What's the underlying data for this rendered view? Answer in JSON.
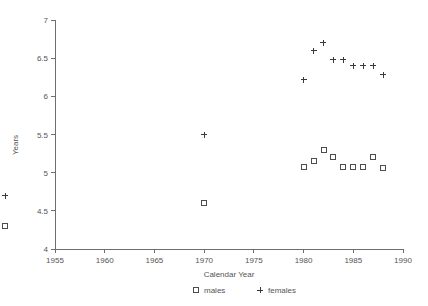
{
  "chart_data": {
    "type": "scatter",
    "title": "",
    "xlabel": "Calendar Year",
    "ylabel": "Years",
    "xlim": [
      1955,
      1990
    ],
    "ylim": [
      4,
      7
    ],
    "xticks": [
      1955,
      1960,
      1965,
      1970,
      1975,
      1980,
      1985,
      1990
    ],
    "xtick_labels": [
      "1955",
      "1960",
      "1965",
      "1970",
      "1975",
      "1980",
      "1985",
      "1990"
    ],
    "yticks": [
      4,
      4.5,
      5,
      5.5,
      6,
      6.5,
      7
    ],
    "ytick_labels": [
      "4",
      "4.5",
      "5",
      "5.5",
      "6",
      "6.5",
      "7"
    ],
    "grid": false,
    "legend_position": "below-xlabel",
    "series": [
      {
        "name": "males",
        "marker": "square",
        "marker_glyph": "□",
        "color": "#4d4d4d",
        "points": [
          {
            "x": 1950,
            "y": 4.3
          },
          {
            "x": 1970,
            "y": 4.6
          },
          {
            "x": 1980,
            "y": 5.08
          },
          {
            "x": 1981,
            "y": 5.16
          },
          {
            "x": 1982,
            "y": 5.3
          },
          {
            "x": 1983,
            "y": 5.2
          },
          {
            "x": 1984,
            "y": 5.08
          },
          {
            "x": 1985,
            "y": 5.08
          },
          {
            "x": 1986,
            "y": 5.08
          },
          {
            "x": 1987,
            "y": 5.2
          },
          {
            "x": 1988,
            "y": 5.06
          }
        ]
      },
      {
        "name": "females",
        "marker": "plus",
        "marker_glyph": "+",
        "color": "#3a3a3a",
        "points": [
          {
            "x": 1950,
            "y": 4.7
          },
          {
            "x": 1970,
            "y": 5.5
          },
          {
            "x": 1980,
            "y": 6.22
          },
          {
            "x": 1981,
            "y": 6.6
          },
          {
            "x": 1982,
            "y": 6.7
          },
          {
            "x": 1983,
            "y": 6.48
          },
          {
            "x": 1984,
            "y": 6.48
          },
          {
            "x": 1985,
            "y": 6.4
          },
          {
            "x": 1986,
            "y": 6.4
          },
          {
            "x": 1987,
            "y": 6.4
          },
          {
            "x": 1988,
            "y": 6.28
          }
        ]
      }
    ],
    "legend": [
      {
        "marker_glyph": "□",
        "label": "males"
      },
      {
        "marker_glyph": "+",
        "label": "females"
      }
    ]
  }
}
